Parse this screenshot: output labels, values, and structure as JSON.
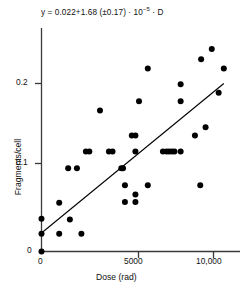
{
  "chart_data": {
    "type": "scatter",
    "title": "",
    "annotation": "y = 0.022+1.68 (±0.17) · 10⁻⁵ · D",
    "annotation_parts": {
      "prefix": "y = 0.022+1.68 (±0.17) · 10",
      "exponent": "−5",
      "suffix": " · D"
    },
    "xlabel": "Dose (rad)",
    "ylabel": "Fragments/cell",
    "xlim": [
      0,
      11200
    ],
    "ylim": [
      0,
      0.245
    ],
    "xticks": [
      0,
      5000,
      10000
    ],
    "xtick_labels": [
      "0",
      "5000",
      "10,000"
    ],
    "yticks": [
      0,
      0.1,
      0.2
    ],
    "ytick_labels": [
      "0",
      "0.1",
      "0.2"
    ],
    "grid": false,
    "legend": "none",
    "marker_color": "#000000",
    "line_color": "#000000",
    "axis_color": "#333333",
    "fit_line": {
      "intercept": 0.022,
      "slope_per_rad": 1.68e-05,
      "slope_error": 1.7e-06,
      "x_start": 0,
      "x_end": 10600,
      "y_start": 0.022,
      "y_end": 0.2
    },
    "points": [
      {
        "x": 0,
        "y": 0.0
      },
      {
        "x": 0,
        "y": 0.021
      },
      {
        "x": 0,
        "y": 0.039
      },
      {
        "x": 1030,
        "y": 0.021
      },
      {
        "x": 1030,
        "y": 0.058
      },
      {
        "x": 1550,
        "y": 0.099
      },
      {
        "x": 1650,
        "y": 0.038
      },
      {
        "x": 2060,
        "y": 0.099
      },
      {
        "x": 2320,
        "y": 0.021
      },
      {
        "x": 2580,
        "y": 0.119
      },
      {
        "x": 2780,
        "y": 0.119
      },
      {
        "x": 3400,
        "y": 0.168
      },
      {
        "x": 3920,
        "y": 0.119
      },
      {
        "x": 4130,
        "y": 0.119
      },
      {
        "x": 4640,
        "y": 0.099
      },
      {
        "x": 4740,
        "y": 0.099
      },
      {
        "x": 4850,
        "y": 0.079
      },
      {
        "x": 4850,
        "y": 0.059
      },
      {
        "x": 5250,
        "y": 0.138
      },
      {
        "x": 5460,
        "y": 0.138
      },
      {
        "x": 5460,
        "y": 0.119
      },
      {
        "x": 5460,
        "y": 0.068
      },
      {
        "x": 5460,
        "y": 0.059
      },
      {
        "x": 5670,
        "y": 0.179
      },
      {
        "x": 6180,
        "y": 0.079
      },
      {
        "x": 6180,
        "y": 0.218
      },
      {
        "x": 7060,
        "y": 0.119
      },
      {
        "x": 7270,
        "y": 0.119
      },
      {
        "x": 7420,
        "y": 0.119
      },
      {
        "x": 7580,
        "y": 0.119
      },
      {
        "x": 7730,
        "y": 0.119
      },
      {
        "x": 8090,
        "y": 0.199
      },
      {
        "x": 8090,
        "y": 0.179
      },
      {
        "x": 8090,
        "y": 0.119
      },
      {
        "x": 8920,
        "y": 0.138
      },
      {
        "x": 9230,
        "y": 0.079
      },
      {
        "x": 9280,
        "y": 0.229
      },
      {
        "x": 9540,
        "y": 0.148
      },
      {
        "x": 9900,
        "y": 0.241
      },
      {
        "x": 10300,
        "y": 0.189
      },
      {
        "x": 10600,
        "y": 0.218
      }
    ]
  }
}
